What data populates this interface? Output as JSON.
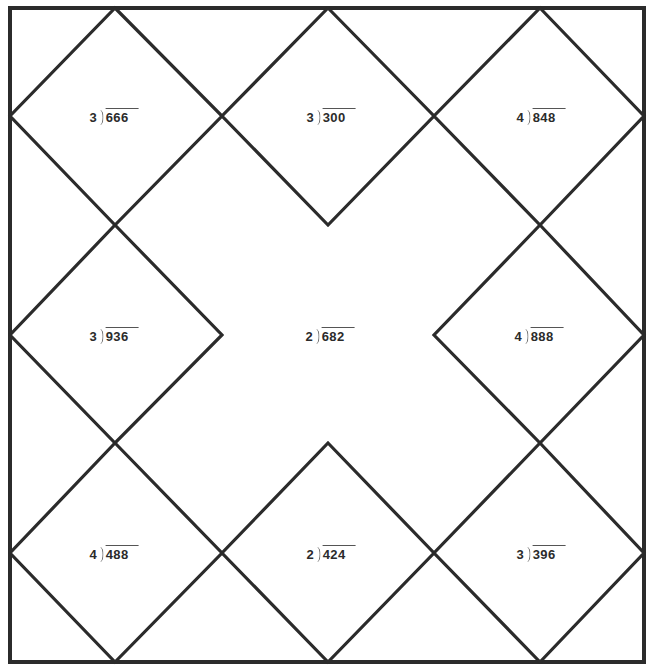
{
  "worksheet": {
    "type": "long-division-diamond-grid",
    "layout": {
      "rows": 3,
      "cols": 3
    },
    "colors": {
      "line": "#2b2b2b",
      "text": "#2b2b2b",
      "background": "#ffffff"
    },
    "problems": [
      {
        "row": 0,
        "col": 0,
        "divisor": "3",
        "dividend": "666"
      },
      {
        "row": 0,
        "col": 1,
        "divisor": "3",
        "dividend": "300"
      },
      {
        "row": 0,
        "col": 2,
        "divisor": "4",
        "dividend": "848"
      },
      {
        "row": 1,
        "col": 0,
        "divisor": "3",
        "dividend": "936"
      },
      {
        "row": 1,
        "col": 1,
        "divisor": "2",
        "dividend": "682"
      },
      {
        "row": 1,
        "col": 2,
        "divisor": "4",
        "dividend": "888"
      },
      {
        "row": 2,
        "col": 0,
        "divisor": "4",
        "dividend": "488"
      },
      {
        "row": 2,
        "col": 1,
        "divisor": "2",
        "dividend": "424"
      },
      {
        "row": 2,
        "col": 2,
        "divisor": "3",
        "dividend": "396"
      }
    ]
  }
}
